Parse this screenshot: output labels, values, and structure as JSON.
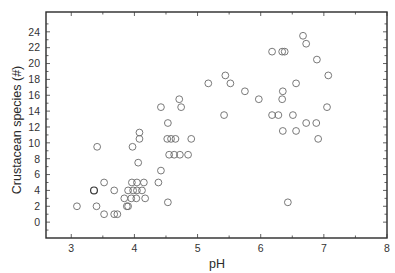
{
  "chart_data": {
    "type": "scatter",
    "title": "",
    "xlabel": "pH",
    "ylabel": "Crustacean species (#)",
    "xlim": [
      2.6,
      8
    ],
    "ylim": [
      -2,
      26.5
    ],
    "x_ticks": [
      3,
      4,
      5,
      6,
      7,
      8
    ],
    "y_ticks": [
      0,
      2,
      4,
      6,
      8,
      10,
      12,
      14,
      16,
      18,
      20,
      22,
      24
    ],
    "grid": false,
    "legend": null,
    "marker": "open-circle",
    "series": [
      {
        "name": "sites",
        "points": [
          [
            3.09,
            2
          ],
          [
            3.4,
            2
          ],
          [
            3.52,
            1
          ],
          [
            3.68,
            1
          ],
          [
            3.73,
            1
          ],
          [
            3.36,
            4
          ],
          [
            3.68,
            4
          ],
          [
            3.52,
            5
          ],
          [
            3.84,
            3
          ],
          [
            3.95,
            3
          ],
          [
            4.03,
            3
          ],
          [
            4.17,
            3
          ],
          [
            3.88,
            2
          ],
          [
            3.9,
            2
          ],
          [
            3.9,
            4
          ],
          [
            3.98,
            4
          ],
          [
            4.04,
            4
          ],
          [
            4.12,
            4
          ],
          [
            3.96,
            5
          ],
          [
            4.04,
            5
          ],
          [
            4.15,
            5
          ],
          [
            4.38,
            5
          ],
          [
            4.42,
            6.5
          ],
          [
            4.06,
            7.5
          ],
          [
            3.41,
            9.5
          ],
          [
            3.97,
            9.5
          ],
          [
            4.08,
            10.5
          ],
          [
            4.08,
            11.3
          ],
          [
            4.55,
            8.5
          ],
          [
            4.63,
            8.5
          ],
          [
            4.72,
            8.5
          ],
          [
            4.85,
            8.5
          ],
          [
            4.52,
            10.5
          ],
          [
            4.58,
            10.5
          ],
          [
            4.65,
            10.5
          ],
          [
            4.9,
            10.5
          ],
          [
            4.53,
            12.5
          ],
          [
            4.42,
            14.5
          ],
          [
            4.74,
            14.5
          ],
          [
            4.71,
            15.5
          ],
          [
            4.53,
            2.5
          ],
          [
            5.17,
            17.5
          ],
          [
            5.44,
            18.5
          ],
          [
            5.52,
            17.5
          ],
          [
            5.42,
            13.5
          ],
          [
            5.75,
            16.5
          ],
          [
            5.97,
            15.5
          ],
          [
            6.18,
            21.5
          ],
          [
            6.34,
            21.5
          ],
          [
            6.38,
            21.5
          ],
          [
            6.67,
            23.5
          ],
          [
            6.72,
            22.5
          ],
          [
            6.89,
            20.5
          ],
          [
            7.07,
            18.5
          ],
          [
            6.56,
            17.5
          ],
          [
            6.35,
            16.5
          ],
          [
            6.34,
            15.5
          ],
          [
            7.05,
            14.5
          ],
          [
            6.18,
            13.5
          ],
          [
            6.28,
            13.5
          ],
          [
            6.51,
            13.5
          ],
          [
            6.72,
            12.5
          ],
          [
            6.88,
            12.5
          ],
          [
            6.35,
            11.5
          ],
          [
            6.56,
            11.5
          ],
          [
            6.91,
            10.5
          ],
          [
            6.43,
            2.5
          ]
        ]
      }
    ],
    "highlighted_points": [
      [
        3.36,
        4
      ]
    ]
  },
  "axes": {
    "x_label": "pH",
    "y_label": "Crustacean species (#)",
    "x_tick_labels": [
      "3",
      "4",
      "5",
      "6",
      "7",
      "8"
    ],
    "y_tick_labels": [
      "0",
      "2",
      "4",
      "6",
      "8",
      "10",
      "12",
      "14",
      "16",
      "18",
      "20",
      "22",
      "24"
    ]
  },
  "colors": {
    "marker_stroke": "#6a6a6a",
    "highlight_stroke": "#333333",
    "frame": "#2a2a2a"
  }
}
